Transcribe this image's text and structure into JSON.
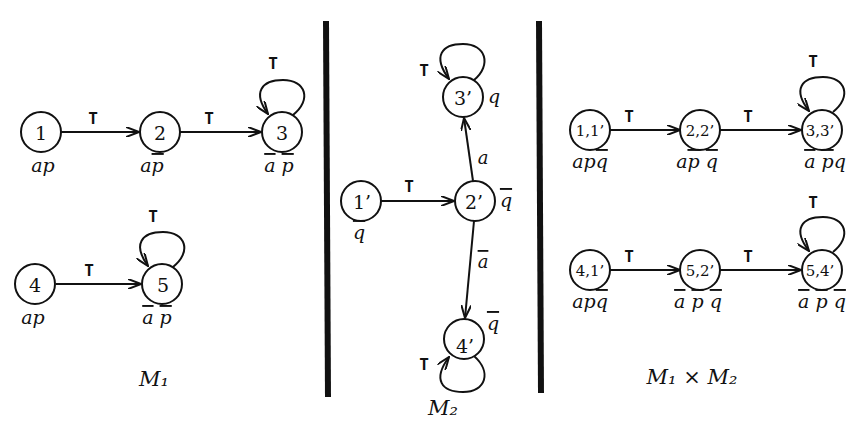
{
  "diagram": {
    "panels": [
      {
        "id": "M1",
        "caption": "M₁",
        "nodes": [
          {
            "id": "1",
            "label": "1",
            "props": "ap"
          },
          {
            "id": "2",
            "label": "2",
            "props": "ap̄"
          },
          {
            "id": "3",
            "label": "3",
            "props": "ā p̄"
          },
          {
            "id": "4",
            "label": "4",
            "props": "ap"
          },
          {
            "id": "5",
            "label": "5",
            "props": "ā p̄"
          }
        ],
        "edges": [
          {
            "from": "1",
            "to": "2",
            "label": "T"
          },
          {
            "from": "2",
            "to": "3",
            "label": "T"
          },
          {
            "from": "3",
            "to": "3",
            "label": "T"
          },
          {
            "from": "4",
            "to": "5",
            "label": "T"
          },
          {
            "from": "5",
            "to": "5",
            "label": "T"
          }
        ]
      },
      {
        "id": "M2",
        "caption": "M₂",
        "nodes": [
          {
            "id": "1'",
            "label": "1’",
            "props": "q̄"
          },
          {
            "id": "2'",
            "label": "2’",
            "props": "q̄"
          },
          {
            "id": "3'",
            "label": "3’",
            "props": "q"
          },
          {
            "id": "4'",
            "label": "4’",
            "props": "q̄"
          }
        ],
        "edges": [
          {
            "from": "1'",
            "to": "2'",
            "label": "T"
          },
          {
            "from": "2'",
            "to": "3'",
            "label": "a"
          },
          {
            "from": "2'",
            "to": "4'",
            "label": "ā"
          },
          {
            "from": "3'",
            "to": "3'",
            "label": "T"
          },
          {
            "from": "4'",
            "to": "4'",
            "label": "T"
          }
        ]
      },
      {
        "id": "M1xM2",
        "caption": "M₁ × M₂",
        "nodes": [
          {
            "id": "1,1'",
            "label": "1,1’",
            "props": "apq̄"
          },
          {
            "id": "2,2'",
            "label": "2,2’",
            "props": "ap̄ q̄"
          },
          {
            "id": "3,3'",
            "label": "3,3’",
            "props": "ā p̄q"
          },
          {
            "id": "4,1'",
            "label": "4,1’",
            "props": "apq̄"
          },
          {
            "id": "5,2'",
            "label": "5,2’",
            "props": "ā p̄ q̄"
          },
          {
            "id": "5,4'",
            "label": "5,4’",
            "props": "ā p̄ q̄"
          }
        ],
        "edges": [
          {
            "from": "1,1'",
            "to": "2,2'",
            "label": "T"
          },
          {
            "from": "2,2'",
            "to": "3,3'",
            "label": "T"
          },
          {
            "from": "3,3'",
            "to": "3,3'",
            "label": "T"
          },
          {
            "from": "4,1'",
            "to": "5,2'",
            "label": "T"
          },
          {
            "from": "5,2'",
            "to": "5,4'",
            "label": "T"
          },
          {
            "from": "5,4'",
            "to": "5,4'",
            "label": "T"
          }
        ]
      }
    ],
    "colors": {
      "ink": "#111111",
      "background": "#ffffff"
    }
  }
}
